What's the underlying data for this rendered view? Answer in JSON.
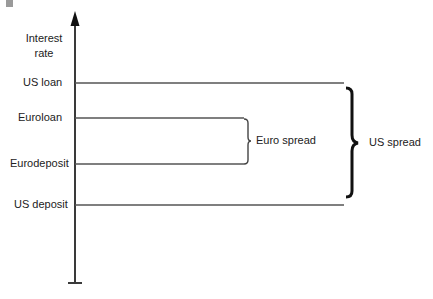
{
  "diagram": {
    "axis": {
      "title_line1": "Interest",
      "title_line2": "rate"
    },
    "levels": [
      {
        "label": "US loan",
        "y": 83,
        "x_end": 344
      },
      {
        "label": "Euroloan",
        "y": 118,
        "x_end": 244
      },
      {
        "label": "Eurodeposit",
        "y": 164,
        "x_end": 244
      },
      {
        "label": "US deposit",
        "y": 205,
        "x_end": 344
      }
    ],
    "braces": [
      {
        "label": "Euro spread",
        "from": "Euroloan",
        "to": "Eurodeposit"
      },
      {
        "label": "US spread",
        "from": "US loan",
        "to": "US deposit"
      }
    ],
    "colors": {
      "line": "#3a3a3a",
      "brace": "#111111",
      "marker": "#9a9a9a"
    }
  }
}
